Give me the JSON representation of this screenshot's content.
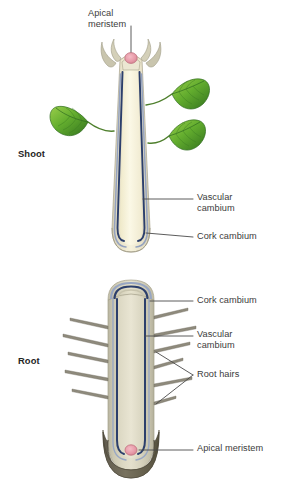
{
  "diagram": {
    "background_color": "#ffffff",
    "labels": {
      "apical_meristem_top": "Apical\nmeristem",
      "shoot": "Shoot",
      "vascular_cambium_shoot": "Vascular\ncambium",
      "cork_cambium_shoot": "Cork cambium",
      "cork_cambium_root": "Cork cambium",
      "vascular_cambium_root": "Vascular\ncambium",
      "root_hairs": "Root hairs",
      "root": "Root",
      "apical_meristem_bottom": "Apical meristem"
    },
    "colors": {
      "leader_line": "#4a4a4a",
      "text": "#3b3b3b",
      "text_bold": "#252525",
      "stem_outer": "#d8d3bd",
      "stem_core": "#f3efd6",
      "stem_pith": "#faf7e4",
      "cambium_line": "#2b3f6b",
      "cork_line": "#9aa8c4",
      "root_outer": "#c7c3ad",
      "root_core": "#ded9c2",
      "root_cap": "#6f6a5c",
      "apical_dot": "#e8a0ad",
      "apical_dot_edge": "#c4707f",
      "leaf_light": "#8dc640",
      "leaf_mid": "#5da52f",
      "leaf_dark": "#2f6b1f",
      "petiole": "#4a7a2a",
      "root_hair": "#8e8a7c"
    },
    "parts": {
      "shoot_apical_dot": "apical-meristem-dot",
      "root_apical_dot": "apical-meristem-dot",
      "leaf_count": 3,
      "root_hair_count_left": 5,
      "root_hair_count_right": 6
    }
  }
}
